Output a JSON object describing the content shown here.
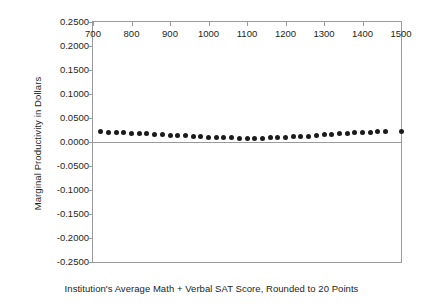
{
  "chart_data": {
    "type": "scatter",
    "title": "",
    "xlabel": "Institution's Average Math + Verbal SAT Score, Rounded to 20 Points",
    "ylabel": "Marginal Productivity in Dollars",
    "xlim": [
      700,
      1500
    ],
    "ylim": [
      -0.25,
      0.25
    ],
    "grid": false,
    "legend": null,
    "xticks": [
      700,
      800,
      900,
      1000,
      1100,
      1200,
      1300,
      1400,
      1500
    ],
    "xtick_labels": [
      "700",
      "800",
      "900",
      "1000",
      "1100",
      "1200",
      "1300",
      "1400",
      "1500"
    ],
    "yticks": [
      0.25,
      0.2,
      0.15,
      0.1,
      0.05,
      0.0,
      -0.05,
      -0.1,
      -0.15,
      -0.2,
      -0.25
    ],
    "ytick_labels": [
      "0.2500",
      "0.2000",
      "0.1500",
      "0.1000",
      "0.0500",
      "0.0000",
      "-0.0500",
      "-0.1000",
      "-0.1500",
      "-0.2000",
      "-0.2500"
    ],
    "zero_line": 0.0,
    "marker_color": "#1b1b1b",
    "axis_color": "#9a9a9a",
    "series": [
      {
        "name": "Marginal Productivity",
        "x": [
          720,
          740,
          760,
          780,
          800,
          820,
          840,
          860,
          880,
          900,
          920,
          940,
          960,
          980,
          1000,
          1020,
          1040,
          1060,
          1080,
          1100,
          1120,
          1140,
          1160,
          1180,
          1200,
          1220,
          1240,
          1260,
          1280,
          1300,
          1320,
          1340,
          1360,
          1380,
          1400,
          1420,
          1440,
          1460,
          1500
        ],
        "y": [
          0.0215,
          0.0208,
          0.02,
          0.0192,
          0.0183,
          0.0175,
          0.0167,
          0.0158,
          0.015,
          0.0142,
          0.0135,
          0.0127,
          0.0119,
          0.0112,
          0.0104,
          0.0098,
          0.0092,
          0.0087,
          0.0083,
          0.0081,
          0.0081,
          0.0083,
          0.0087,
          0.0092,
          0.0098,
          0.0106,
          0.0115,
          0.0125,
          0.0135,
          0.0146,
          0.0156,
          0.0167,
          0.0177,
          0.0188,
          0.0198,
          0.0208,
          0.0217,
          0.0225,
          0.0225
        ]
      }
    ]
  }
}
